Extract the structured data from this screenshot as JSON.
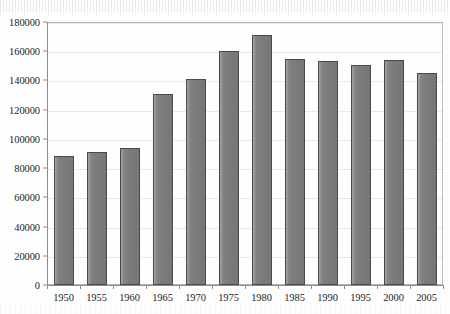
{
  "chart_data": {
    "type": "bar",
    "title": "",
    "subtitle": "",
    "xlabel": "",
    "ylabel": "",
    "categories": [
      "1950",
      "1955",
      "1960",
      "1965",
      "1970",
      "1975",
      "1980",
      "1985",
      "1990",
      "1995",
      "2000",
      "2005"
    ],
    "values": [
      88000,
      91000,
      94000,
      131000,
      141000,
      160000,
      171000,
      154500,
      153500,
      150500,
      154000,
      145000
    ],
    "ylim": [
      0,
      180000
    ],
    "y_ticks": [
      0,
      20000,
      40000,
      60000,
      80000,
      100000,
      120000,
      140000,
      160000,
      180000
    ],
    "y_tick_labels": [
      "0",
      "20000",
      "40000",
      "60000",
      "80000",
      "100000",
      "120000",
      "140000",
      "160000",
      "180000"
    ],
    "x_tick_labels": [
      "1950",
      "1955",
      "1960",
      "1965",
      "1970",
      "1975",
      "1980",
      "1985",
      "1990",
      "1995",
      "2000",
      "2005"
    ],
    "grid": true,
    "legend": false,
    "legend_position": "none",
    "annotations": [],
    "series": [
      {
        "name": "",
        "values": [
          88000,
          91000,
          94000,
          131000,
          141000,
          160000,
          171000,
          154500,
          153500,
          150500,
          154000,
          145000
        ]
      }
    ]
  },
  "style": {
    "bar_fill": "#7d7d7d",
    "bar_edge": "#4a4a4a",
    "axis_color": "#8d8d8d",
    "grid_color": "#e9e9e9",
    "text_color": "#1d1d1d",
    "background": "#ffffff"
  }
}
